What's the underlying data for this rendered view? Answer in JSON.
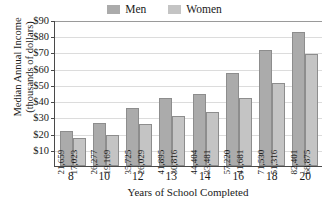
{
  "chart_data": {
    "type": "bar",
    "title": "",
    "xlabel": "Years of School Completed",
    "ylabel": "Median Annual Income (thousands of dollars)",
    "ylabel_line1": "Median Annual Income",
    "ylabel_line2": "(thousands of dollars)",
    "categories": [
      "8",
      "10",
      "12",
      "13",
      "14",
      "16",
      "18",
      "20"
    ],
    "series": [
      {
        "name": "Men",
        "color": "#ababab",
        "values": [
          21659,
          26277,
          35725,
          41895,
          44404,
          57220,
          71530,
          82401
        ],
        "labels": [
          "21,659",
          "26,277",
          "35,725",
          "41,895",
          "44,404",
          "57,220",
          "71,530",
          "82,401"
        ]
      },
      {
        "name": "Women",
        "color": "#c4c4c4",
        "values": [
          17023,
          19169,
          26029,
          30816,
          33481,
          41681,
          51316,
          68875
        ],
        "labels": [
          "17,023",
          "19,169",
          "26,029",
          "30,816",
          "33,481",
          "41,681",
          "51,316",
          "68,875"
        ]
      }
    ],
    "ylim": [
      0,
      90000
    ],
    "yticks": [
      10000,
      20000,
      30000,
      40000,
      50000,
      60000,
      70000,
      80000,
      90000
    ],
    "ytick_labels": [
      "$10",
      "$20",
      "$30",
      "$40",
      "$50",
      "$60",
      "$70",
      "$80",
      "$90"
    ],
    "grid": true,
    "legend_position": "top-center"
  }
}
